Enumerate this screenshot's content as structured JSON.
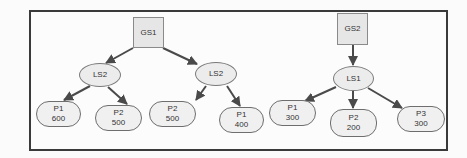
{
  "diagram": {
    "type": "tree",
    "trees": [
      {
        "root": {
          "id": "gs1",
          "label": "GS1",
          "shape": "square"
        },
        "children": [
          {
            "id": "ls2a",
            "label": "LS2",
            "shape": "ellipse",
            "children": [
              {
                "id": "p1_600",
                "name": "P1",
                "value": "600"
              },
              {
                "id": "p2_500a",
                "name": "P2",
                "value": "500"
              }
            ]
          },
          {
            "id": "ls2b",
            "label": "LS2",
            "shape": "ellipse",
            "children": [
              {
                "id": "p2_500b",
                "name": "P2",
                "value": "500"
              },
              {
                "id": "p1_400",
                "name": "P1",
                "value": "400"
              }
            ]
          }
        ]
      },
      {
        "root": {
          "id": "gs2",
          "label": "GS2",
          "shape": "square"
        },
        "children": [
          {
            "id": "ls1",
            "label": "LS1",
            "shape": "ellipse",
            "children": [
              {
                "id": "p1_300",
                "name": "P1",
                "value": "300"
              },
              {
                "id": "p2_200",
                "name": "P2",
                "value": "200"
              },
              {
                "id": "p3_300",
                "name": "P3",
                "value": "300"
              }
            ]
          }
        ]
      }
    ]
  },
  "nodes": {
    "gs1": {
      "label": "GS1"
    },
    "gs2": {
      "label": "GS2"
    },
    "ls2a": {
      "label": "LS2"
    },
    "ls2b": {
      "label": "LS2"
    },
    "ls1": {
      "label": "LS1"
    },
    "p1_600": {
      "name": "P1",
      "value": "600"
    },
    "p2_500a": {
      "name": "P2",
      "value": "500"
    },
    "p2_500b": {
      "name": "P2",
      "value": "500"
    },
    "p1_400": {
      "name": "P1",
      "value": "400"
    },
    "p1_300": {
      "name": "P1",
      "value": "300"
    },
    "p2_200": {
      "name": "P2",
      "value": "200"
    },
    "p3_300": {
      "name": "P3",
      "value": "300"
    }
  },
  "colors": {
    "frame": "#3a3a3a",
    "edge": "#4a4a4a",
    "node_fill": "#ececec",
    "text": "#333333"
  }
}
